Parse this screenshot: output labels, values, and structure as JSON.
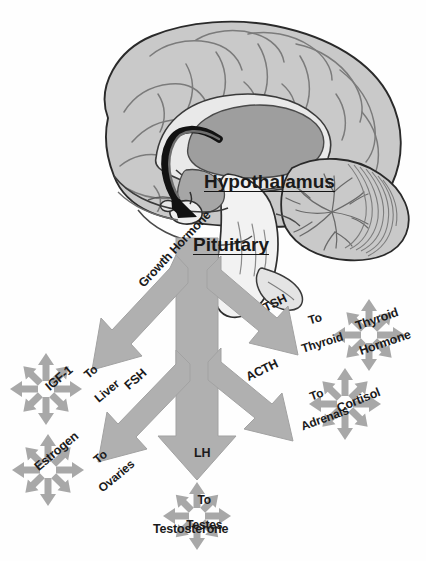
{
  "diagram": {
    "type": "anatomical-flow-diagram",
    "background_color": "#fefefe"
  },
  "colors": {
    "brain_fill": "#c9c9c9",
    "brain_deep_fill": "#9e9e9e",
    "brain_outline": "#2a2a2a",
    "arrow_gray": "#b0b0b0",
    "arrow_gray_edge": "#a2a2a2",
    "burst_gray": "#a8a8a8",
    "black_arrow": "#121212",
    "text": "#1a1a1a"
  },
  "anatomy": {
    "hypothalamus_label": "Hypothalamus",
    "pituitary_label": "Pituitary",
    "feedback_arrow": "hypothalamus-to-pituitary-curved-arrow"
  },
  "pathways": [
    {
      "id": "growth-hormone",
      "hormone": "Growth Hormone",
      "destination_line1": "To",
      "destination_line2": "Liver",
      "product": "IGF-1",
      "direction": "upper-left"
    },
    {
      "id": "fsh",
      "hormone": "FSH",
      "destination_line1": "To",
      "destination_line2": "Ovaries",
      "product": "Estrogen",
      "direction": "lower-left"
    },
    {
      "id": "lh",
      "hormone": "LH",
      "destination_line1": "To",
      "destination_line2": "Testes",
      "product": "Testosterone",
      "direction": "down"
    },
    {
      "id": "tsh",
      "hormone": "TSH",
      "destination_line1": "To",
      "destination_line2": "Thyroid",
      "product_line1": "Thyroid",
      "product_line2": "Hormone",
      "direction": "upper-right"
    },
    {
      "id": "acth",
      "hormone": "ACTH",
      "destination_line1": "To",
      "destination_line2": "Adrenals",
      "product": "Cortisol",
      "direction": "lower-right"
    }
  ]
}
